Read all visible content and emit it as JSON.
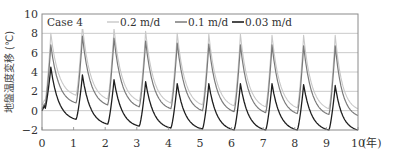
{
  "chart_data": {
    "type": "line",
    "title": "",
    "annotation": "Case 4",
    "xlabel": "(年)",
    "ylabel": "地盤温度変移 (℃)",
    "xlim": [
      0,
      10
    ],
    "ylim": [
      -2,
      10
    ],
    "xticks": [
      0,
      1,
      2,
      3,
      4,
      5,
      6,
      7,
      8,
      9,
      10
    ],
    "yticks": [
      -2,
      0,
      2,
      4,
      6,
      8,
      10
    ],
    "grid": "horizontal",
    "legend_position": "top-inside",
    "series": [
      {
        "name": "0.2 m/d",
        "color": "#c8c8c8",
        "width": 1.1,
        "peaks": [
          8.0,
          8.8,
          8.5,
          8.2,
          8.0,
          7.9,
          7.9,
          7.8,
          7.8,
          7.8
        ],
        "troughs": [
          1.6,
          1.2,
          1.0,
          0.8,
          0.6,
          0.5,
          0.4,
          0.3,
          0.2,
          0.2
        ],
        "start": 0.6
      },
      {
        "name": "0.1 m/d",
        "color": "#7a7a7a",
        "width": 1.2,
        "peaks": [
          6.8,
          7.7,
          7.5,
          7.2,
          7.0,
          6.9,
          6.8,
          6.8,
          6.7,
          6.7
        ],
        "troughs": [
          0.8,
          0.6,
          0.4,
          0.2,
          0.0,
          -0.1,
          -0.2,
          -0.3,
          -0.4,
          -0.5
        ],
        "start": 0.2
      },
      {
        "name": "0.03 m/d",
        "color": "#1e1e1e",
        "width": 1.3,
        "peaks": [
          4.5,
          3.7,
          3.2,
          3.0,
          2.8,
          2.8,
          2.8,
          2.8,
          2.7,
          2.6
        ],
        "troughs": [
          -0.9,
          -1.4,
          -1.6,
          -1.8,
          -1.9,
          -2.0,
          -2.0,
          -2.0,
          -2.0,
          -2.0
        ],
        "start": 0.0
      }
    ]
  },
  "legend": {
    "case_label": "Case 4",
    "items": [
      "0.2 m/d",
      "0.1 m/d",
      "0.03 m/d"
    ]
  },
  "axes": {
    "x_unit": "(年)",
    "y_label": "地盤温度変移 (℃)"
  }
}
